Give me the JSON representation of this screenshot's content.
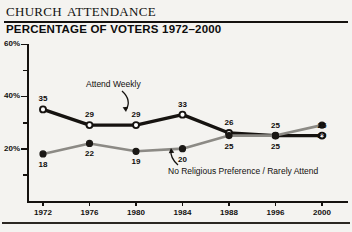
{
  "header": {
    "title": "Church Attendance",
    "subtitle": "PERCENTAGE OF VOTERS 1972–2000"
  },
  "chart_data": {
    "type": "line",
    "title": "Church Attendance",
    "subtitle": "PERCENTAGE OF VOTERS 1972-2000",
    "xlabel": "",
    "ylabel": "",
    "ylim": [
      0,
      60
    ],
    "ytick_labels": [
      "20%",
      "40%",
      "60%"
    ],
    "ytick_values": [
      20,
      40,
      60
    ],
    "yminor_values": [
      10,
      30,
      50
    ],
    "grid": false,
    "legend_position": "inline-annotation",
    "categories": [
      "1972",
      "1976",
      "1980",
      "1984",
      "1988",
      "1996",
      "2000"
    ],
    "series": [
      {
        "name": "Attend Weekly",
        "color": "#161310",
        "marker": "open-circle",
        "values": [
          35,
          29,
          29,
          33,
          26,
          25,
          25
        ],
        "label_position": "above"
      },
      {
        "name": "No Religious Preference / Rarely Attend",
        "color": "#8c8a85",
        "marker": "filled-circle",
        "values": [
          18,
          22,
          19,
          20,
          25,
          25,
          29
        ],
        "label_position": "below"
      }
    ],
    "annotations": [
      {
        "text": "Attend Weekly",
        "target_series": "Attend Weekly"
      },
      {
        "text": "No Religious Preference / Rarely Attend",
        "target_series": "No Religious Preference / Rarely Attend"
      }
    ]
  }
}
